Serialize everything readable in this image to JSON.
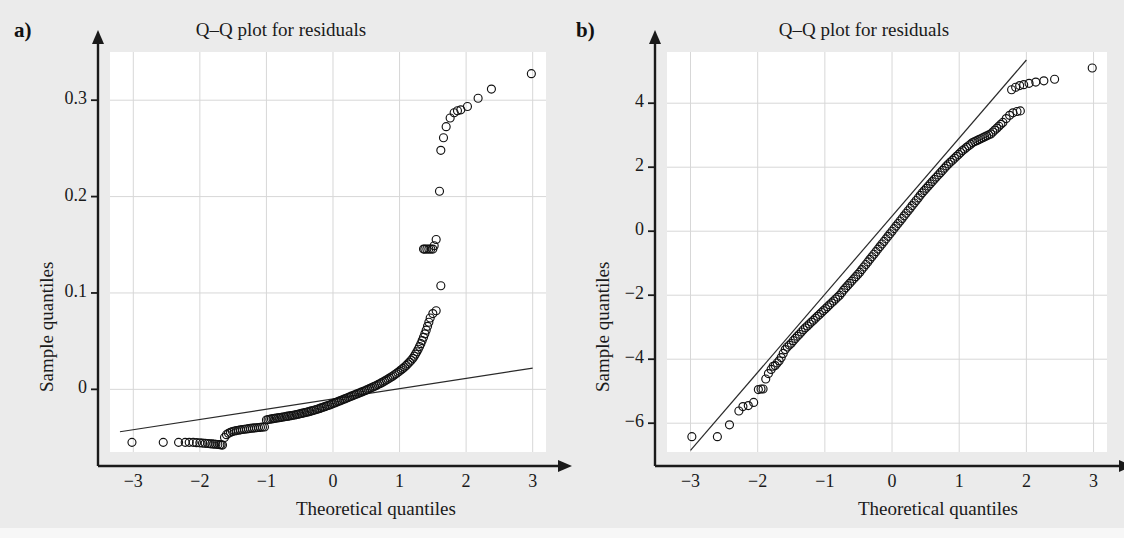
{
  "figure": {
    "background": "#ebebeb",
    "panels": [
      {
        "label": "a)",
        "title": "Q–Q plot for residuals",
        "xlabel": "Theoretical quantiles",
        "ylabel": "Sample quantiles"
      },
      {
        "label": "b)",
        "title": "Q–Q plot for residuals",
        "xlabel": "Theoretical quantiles",
        "ylabel": "Sample quantiles"
      }
    ]
  },
  "chart_data": [
    {
      "type": "scatter",
      "panel": "a)",
      "title": "Q–Q plot for residuals",
      "xlabel": "Theoretical quantiles",
      "ylabel": "Sample quantiles",
      "xlim": [
        -3.35,
        3.2
      ],
      "ylim": [
        -0.065,
        0.35
      ],
      "xticks": [
        -3,
        -2,
        -1,
        0,
        1,
        2,
        3
      ],
      "xticklabels": [
        "−3",
        "−2",
        "−1",
        "0",
        "1",
        "2",
        "3"
      ],
      "yticks": [
        0,
        0.1,
        0.2,
        0.3
      ],
      "yticklabels": [
        "0",
        "0.1",
        "0.2",
        "0.3"
      ],
      "grid": true,
      "legend": null,
      "reference_line": {
        "x": [
          -3.2,
          3.0
        ],
        "y": [
          -0.044,
          0.022
        ]
      },
      "points": [
        [
          -3.02,
          -0.055
        ],
        [
          -2.55,
          -0.055
        ],
        [
          -2.32,
          -0.055
        ],
        [
          -2.22,
          -0.055
        ],
        [
          -2.16,
          -0.055
        ],
        [
          -2.1,
          -0.055
        ],
        [
          -2.05,
          -0.0553
        ],
        [
          -2.0,
          -0.0555
        ],
        [
          -1.96,
          -0.0558
        ],
        [
          -1.92,
          -0.056
        ],
        [
          -1.88,
          -0.0562
        ],
        [
          -1.85,
          -0.0564
        ],
        [
          -1.82,
          -0.0566
        ],
        [
          -1.79,
          -0.0568
        ],
        [
          -1.76,
          -0.057
        ],
        [
          -1.73,
          -0.0572
        ],
        [
          -1.7,
          -0.0574
        ],
        [
          -1.68,
          -0.0576
        ],
        [
          -1.66,
          -0.0578
        ],
        [
          -1.63,
          -0.05
        ],
        [
          -1.6,
          -0.047
        ],
        [
          -1.57,
          -0.0455
        ],
        [
          -1.54,
          -0.0445
        ],
        [
          -1.51,
          -0.0438
        ],
        [
          -1.48,
          -0.0432
        ],
        [
          -1.45,
          -0.0428
        ],
        [
          -1.42,
          -0.0424
        ],
        [
          -1.39,
          -0.042
        ],
        [
          -1.36,
          -0.0417
        ],
        [
          -1.33,
          -0.0414
        ],
        [
          -1.3,
          -0.0411
        ],
        [
          -1.27,
          -0.0408
        ],
        [
          -1.24,
          -0.0405
        ],
        [
          -1.21,
          -0.0403
        ],
        [
          -1.18,
          -0.04
        ],
        [
          -1.15,
          -0.0398
        ],
        [
          -1.12,
          -0.0396
        ],
        [
          -1.09,
          -0.0394
        ],
        [
          -1.06,
          -0.0392
        ],
        [
          -1.03,
          -0.039
        ],
        [
          -1.0,
          -0.0318
        ],
        [
          -0.975,
          -0.0313
        ],
        [
          -0.95,
          -0.031
        ],
        [
          -0.925,
          -0.0307
        ],
        [
          -0.9,
          -0.0304
        ],
        [
          -0.875,
          -0.0301
        ],
        [
          -0.85,
          -0.0298
        ],
        [
          -0.825,
          -0.0296
        ],
        [
          -0.8,
          -0.0293
        ],
        [
          -0.775,
          -0.029
        ],
        [
          -0.75,
          -0.0287
        ],
        [
          -0.725,
          -0.0284
        ],
        [
          -0.7,
          -0.0281
        ],
        [
          -0.675,
          -0.0278
        ],
        [
          -0.65,
          -0.0275
        ],
        [
          -0.625,
          -0.0272
        ],
        [
          -0.6,
          -0.0269
        ],
        [
          -0.575,
          -0.0266
        ],
        [
          -0.55,
          -0.0262
        ],
        [
          -0.525,
          -0.0258
        ],
        [
          -0.5,
          -0.0254
        ],
        [
          -0.475,
          -0.025
        ],
        [
          -0.45,
          -0.0246
        ],
        [
          -0.425,
          -0.0242
        ],
        [
          -0.4,
          -0.0238
        ],
        [
          -0.375,
          -0.0234
        ],
        [
          -0.35,
          -0.0229
        ],
        [
          -0.325,
          -0.0224
        ],
        [
          -0.3,
          -0.0219
        ],
        [
          -0.275,
          -0.0214
        ],
        [
          -0.25,
          -0.0209
        ],
        [
          -0.225,
          -0.0204
        ],
        [
          -0.2,
          -0.0198
        ],
        [
          -0.175,
          -0.0192
        ],
        [
          -0.15,
          -0.0186
        ],
        [
          -0.125,
          -0.018
        ],
        [
          -0.1,
          -0.0174
        ],
        [
          -0.075,
          -0.0168
        ],
        [
          -0.05,
          -0.0162
        ],
        [
          -0.025,
          -0.0155
        ],
        [
          0.0,
          -0.0148
        ],
        [
          0.025,
          -0.0141
        ],
        [
          0.05,
          -0.0134
        ],
        [
          0.075,
          -0.0127
        ],
        [
          0.1,
          -0.012
        ],
        [
          0.125,
          -0.0113
        ],
        [
          0.15,
          -0.0106
        ],
        [
          0.175,
          -0.0099
        ],
        [
          0.2,
          -0.0092
        ],
        [
          0.225,
          -0.0085
        ],
        [
          0.25,
          -0.0078
        ],
        [
          0.275,
          -0.0071
        ],
        [
          0.3,
          -0.0064
        ],
        [
          0.325,
          -0.0057
        ],
        [
          0.35,
          -0.005
        ],
        [
          0.375,
          -0.0043
        ],
        [
          0.4,
          -0.0036
        ],
        [
          0.425,
          -0.0029
        ],
        [
          0.45,
          -0.0022
        ],
        [
          0.475,
          -0.0015
        ],
        [
          0.5,
          -0.0008
        ],
        [
          0.525,
          0.0
        ],
        [
          0.55,
          0.0008
        ],
        [
          0.575,
          0.0016
        ],
        [
          0.6,
          0.0024
        ],
        [
          0.625,
          0.0032
        ],
        [
          0.65,
          0.004
        ],
        [
          0.675,
          0.0049
        ],
        [
          0.7,
          0.0058
        ],
        [
          0.725,
          0.0067
        ],
        [
          0.75,
          0.0076
        ],
        [
          0.775,
          0.0086
        ],
        [
          0.8,
          0.0096
        ],
        [
          0.825,
          0.0106
        ],
        [
          0.85,
          0.0117
        ],
        [
          0.875,
          0.0128
        ],
        [
          0.9,
          0.0139
        ],
        [
          0.925,
          0.0151
        ],
        [
          0.95,
          0.0163
        ],
        [
          0.975,
          0.0176
        ],
        [
          1.0,
          0.0189
        ],
        [
          1.025,
          0.0203
        ],
        [
          1.05,
          0.0217
        ],
        [
          1.075,
          0.0232
        ],
        [
          1.1,
          0.0248
        ],
        [
          1.125,
          0.0265
        ],
        [
          1.15,
          0.0283
        ],
        [
          1.175,
          0.0302
        ],
        [
          1.2,
          0.0322
        ],
        [
          1.22,
          0.0343
        ],
        [
          1.24,
          0.0366
        ],
        [
          1.26,
          0.039
        ],
        [
          1.28,
          0.0416
        ],
        [
          1.3,
          0.0444
        ],
        [
          1.32,
          0.0474
        ],
        [
          1.34,
          0.0506
        ],
        [
          1.36,
          0.054
        ],
        [
          1.38,
          0.0576
        ],
        [
          1.4,
          0.0614
        ],
        [
          1.42,
          0.0654
        ],
        [
          1.44,
          0.0696
        ],
        [
          1.46,
          0.074
        ],
        [
          1.5,
          0.0786
        ],
        [
          1.55,
          0.0815
        ],
        [
          1.62,
          0.1075
        ],
        [
          1.5,
          0.1455
        ],
        [
          1.47,
          0.1455
        ],
        [
          1.44,
          0.1455
        ],
        [
          1.41,
          0.1455
        ],
        [
          1.38,
          0.1455
        ],
        [
          1.36,
          0.1455
        ],
        [
          1.52,
          0.149
        ],
        [
          1.55,
          0.1555
        ],
        [
          1.6,
          0.2055
        ],
        [
          1.62,
          0.248
        ],
        [
          1.66,
          0.261
        ],
        [
          1.7,
          0.2725
        ],
        [
          1.76,
          0.2815
        ],
        [
          1.82,
          0.287
        ],
        [
          1.87,
          0.289
        ],
        [
          1.92,
          0.29
        ],
        [
          2.02,
          0.2935
        ],
        [
          2.18,
          0.302
        ],
        [
          2.38,
          0.3115
        ],
        [
          2.98,
          0.3275
        ]
      ]
    },
    {
      "type": "scatter",
      "panel": "b)",
      "title": "Q–Q plot for residuals",
      "xlabel": "Theoretical quantiles",
      "ylabel": "Sample quantiles",
      "xlim": [
        -3.35,
        3.2
      ],
      "ylim": [
        -6.9,
        5.6
      ],
      "xticks": [
        -3,
        -2,
        -1,
        0,
        1,
        2,
        3
      ],
      "xticklabels": [
        "−3",
        "−2",
        "−1",
        "0",
        "1",
        "2",
        "3"
      ],
      "yticks": [
        -6,
        -4,
        -2,
        0,
        2,
        4
      ],
      "yticklabels": [
        "−6",
        "−4",
        "−2",
        "0",
        "2",
        "4"
      ],
      "grid": true,
      "legend": null,
      "reference_line": {
        "x": [
          -3.0,
          2.0
        ],
        "y": [
          -6.85,
          5.35
        ]
      },
      "points": [
        [
          -2.98,
          -6.42
        ],
        [
          -2.6,
          -6.42
        ],
        [
          -2.42,
          -6.05
        ],
        [
          -2.28,
          -5.62
        ],
        [
          -2.22,
          -5.48
        ],
        [
          -2.14,
          -5.45
        ],
        [
          -2.06,
          -5.35
        ],
        [
          -1.99,
          -4.95
        ],
        [
          -1.95,
          -4.93
        ],
        [
          -1.92,
          -4.93
        ],
        [
          -1.88,
          -4.62
        ],
        [
          -1.84,
          -4.45
        ],
        [
          -1.8,
          -4.32
        ],
        [
          -1.77,
          -4.22
        ],
        [
          -1.74,
          -4.2
        ],
        [
          -1.71,
          -4.12
        ],
        [
          -1.68,
          -4.05
        ],
        [
          -1.65,
          -3.95
        ],
        [
          -1.62,
          -3.82
        ],
        [
          -1.59,
          -3.7
        ],
        [
          -1.56,
          -3.62
        ],
        [
          -1.53,
          -3.56
        ],
        [
          -1.5,
          -3.5
        ],
        [
          -1.47,
          -3.42
        ],
        [
          -1.44,
          -3.35
        ],
        [
          -1.41,
          -3.28
        ],
        [
          -1.38,
          -3.22
        ],
        [
          -1.35,
          -3.15
        ],
        [
          -1.32,
          -3.08
        ],
        [
          -1.29,
          -3.02
        ],
        [
          -1.26,
          -2.96
        ],
        [
          -1.23,
          -2.9
        ],
        [
          -1.2,
          -2.84
        ],
        [
          -1.17,
          -2.78
        ],
        [
          -1.14,
          -2.72
        ],
        [
          -1.11,
          -2.66
        ],
        [
          -1.08,
          -2.6
        ],
        [
          -1.05,
          -2.54
        ],
        [
          -1.02,
          -2.48
        ],
        [
          -0.99,
          -2.42
        ],
        [
          -0.96,
          -2.36
        ],
        [
          -0.93,
          -2.3
        ],
        [
          -0.9,
          -2.24
        ],
        [
          -0.87,
          -2.18
        ],
        [
          -0.84,
          -2.12
        ],
        [
          -0.81,
          -2.06
        ],
        [
          -0.78,
          -2.0
        ],
        [
          -0.75,
          -1.92
        ],
        [
          -0.72,
          -1.84
        ],
        [
          -0.69,
          -1.77
        ],
        [
          -0.66,
          -1.7
        ],
        [
          -0.63,
          -1.63
        ],
        [
          -0.6,
          -1.56
        ],
        [
          -0.57,
          -1.49
        ],
        [
          -0.54,
          -1.42
        ],
        [
          -0.51,
          -1.35
        ],
        [
          -0.48,
          -1.28
        ],
        [
          -0.45,
          -1.2
        ],
        [
          -0.42,
          -1.12
        ],
        [
          -0.39,
          -1.04
        ],
        [
          -0.36,
          -0.96
        ],
        [
          -0.33,
          -0.88
        ],
        [
          -0.3,
          -0.8
        ],
        [
          -0.27,
          -0.72
        ],
        [
          -0.24,
          -0.64
        ],
        [
          -0.21,
          -0.56
        ],
        [
          -0.18,
          -0.48
        ],
        [
          -0.15,
          -0.4
        ],
        [
          -0.12,
          -0.32
        ],
        [
          -0.09,
          -0.24
        ],
        [
          -0.06,
          -0.16
        ],
        [
          -0.03,
          -0.08
        ],
        [
          0.0,
          0.0
        ],
        [
          0.03,
          0.08
        ],
        [
          0.06,
          0.16
        ],
        [
          0.09,
          0.24
        ],
        [
          0.12,
          0.32
        ],
        [
          0.15,
          0.4
        ],
        [
          0.18,
          0.48
        ],
        [
          0.21,
          0.56
        ],
        [
          0.24,
          0.64
        ],
        [
          0.27,
          0.72
        ],
        [
          0.3,
          0.8
        ],
        [
          0.33,
          0.88
        ],
        [
          0.36,
          0.96
        ],
        [
          0.39,
          1.04
        ],
        [
          0.42,
          1.12
        ],
        [
          0.45,
          1.2
        ],
        [
          0.48,
          1.27
        ],
        [
          0.51,
          1.34
        ],
        [
          0.54,
          1.41
        ],
        [
          0.57,
          1.48
        ],
        [
          0.6,
          1.55
        ],
        [
          0.63,
          1.62
        ],
        [
          0.66,
          1.69
        ],
        [
          0.69,
          1.76
        ],
        [
          0.72,
          1.83
        ],
        [
          0.75,
          1.9
        ],
        [
          0.78,
          1.97
        ],
        [
          0.81,
          2.04
        ],
        [
          0.84,
          2.1
        ],
        [
          0.87,
          2.16
        ],
        [
          0.9,
          2.22
        ],
        [
          0.93,
          2.28
        ],
        [
          0.96,
          2.34
        ],
        [
          0.99,
          2.4
        ],
        [
          1.02,
          2.46
        ],
        [
          1.05,
          2.52
        ],
        [
          1.08,
          2.57
        ],
        [
          1.11,
          2.62
        ],
        [
          1.14,
          2.67
        ],
        [
          1.17,
          2.72
        ],
        [
          1.2,
          2.77
        ],
        [
          1.23,
          2.8
        ],
        [
          1.26,
          2.83
        ],
        [
          1.29,
          2.86
        ],
        [
          1.32,
          2.89
        ],
        [
          1.35,
          2.92
        ],
        [
          1.38,
          2.95
        ],
        [
          1.41,
          2.98
        ],
        [
          1.44,
          3.01
        ],
        [
          1.47,
          3.04
        ],
        [
          1.5,
          3.1
        ],
        [
          1.53,
          3.16
        ],
        [
          1.56,
          3.22
        ],
        [
          1.59,
          3.28
        ],
        [
          1.62,
          3.34
        ],
        [
          1.65,
          3.4
        ],
        [
          1.7,
          3.52
        ],
        [
          1.75,
          3.62
        ],
        [
          1.8,
          3.7
        ],
        [
          1.86,
          3.74
        ],
        [
          1.91,
          3.76
        ],
        [
          1.78,
          4.42
        ],
        [
          1.84,
          4.5
        ],
        [
          1.9,
          4.55
        ],
        [
          1.96,
          4.58
        ],
        [
          2.04,
          4.62
        ],
        [
          2.14,
          4.66
        ],
        [
          2.26,
          4.7
        ],
        [
          2.42,
          4.75
        ],
        [
          2.98,
          5.1
        ]
      ]
    }
  ]
}
